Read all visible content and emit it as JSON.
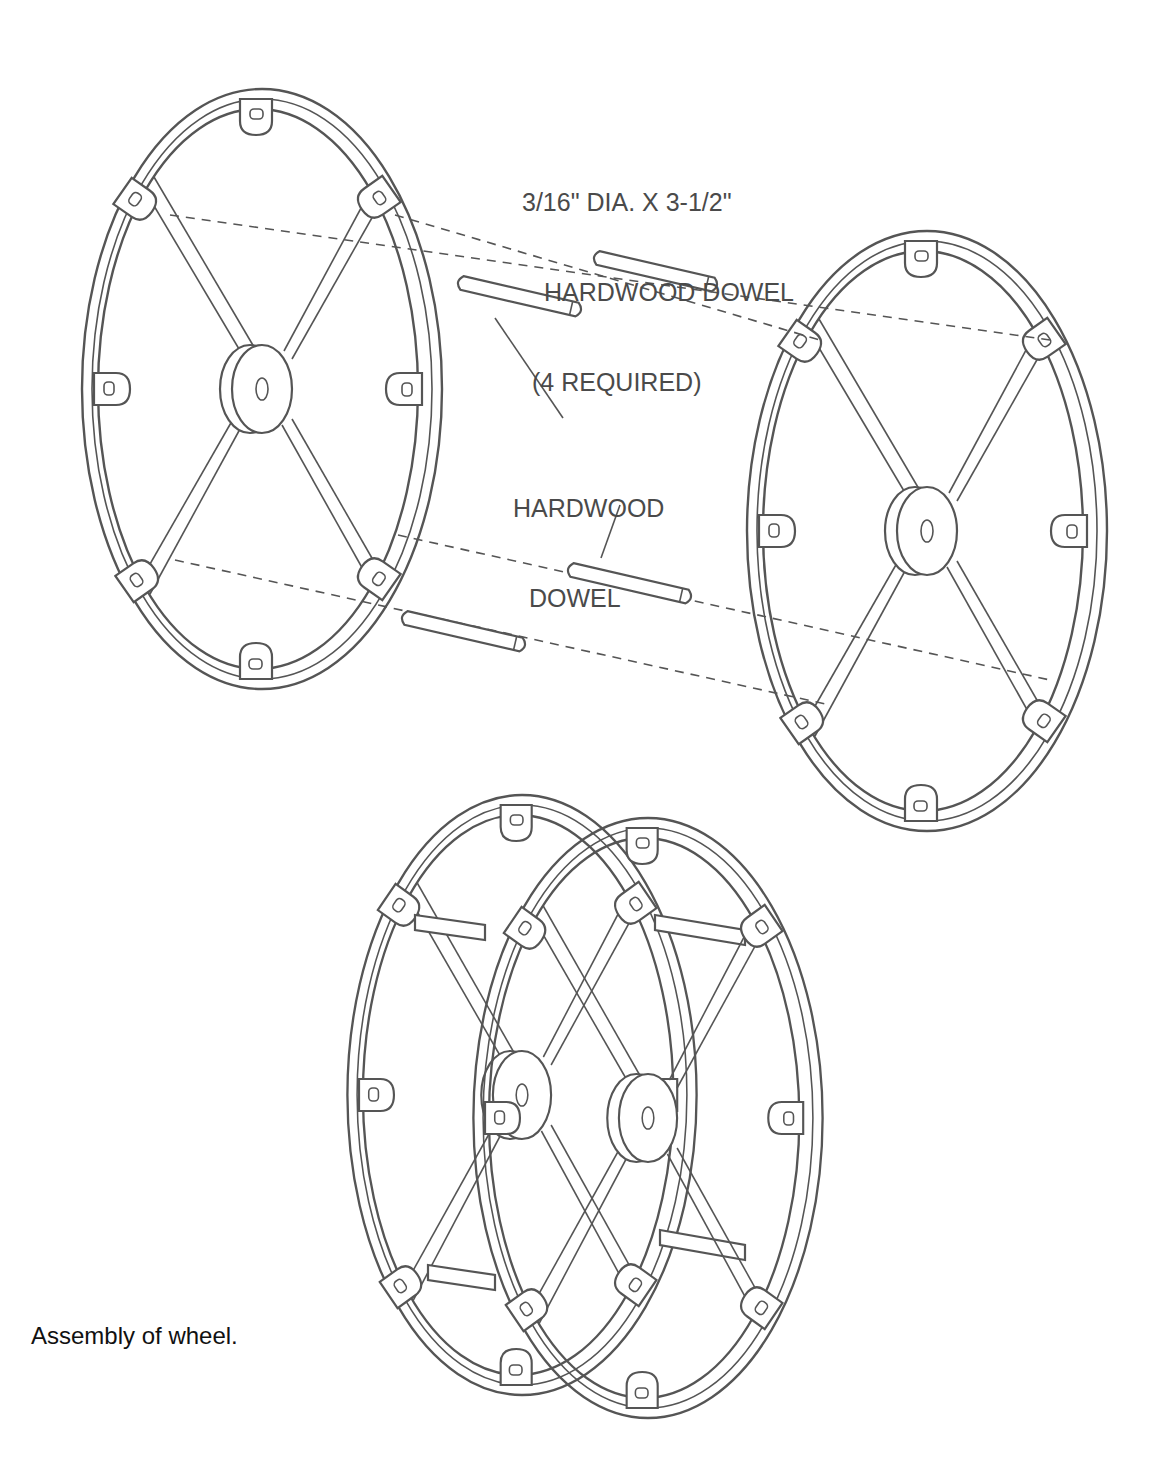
{
  "diagram": {
    "title": "Assembly of wheel.",
    "labels": {
      "dowel_spec": {
        "line1": "3/16\" DIA. X 3-1/2\"",
        "line2": "HARDWOOD DOWEL",
        "line3": "(4 REQUIRED)"
      },
      "dowel_callout": {
        "line1": "HARDWOOD",
        "line2": "DOWEL"
      }
    },
    "components": [
      {
        "name": "left-wheel",
        "description": "Exploded wheel half with 4 spokes, 8 lugs, center hub"
      },
      {
        "name": "right-wheel",
        "description": "Exploded wheel half with 4 spokes, 8 lugs, center hub"
      },
      {
        "name": "dowels",
        "count": 4
      },
      {
        "name": "assembled-wheel",
        "description": "Two wheel halves joined by 4 dowels"
      }
    ],
    "colors": {
      "line": "#555555",
      "label_text": "#4a4a4a",
      "caption_text": "#111111",
      "background": "#ffffff"
    }
  }
}
